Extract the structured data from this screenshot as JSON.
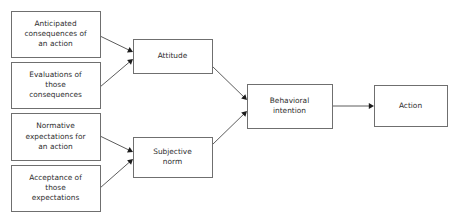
{
  "diagram": {
    "type": "flowchart",
    "background_color": "#ffffff",
    "box_fill": "#ffffff",
    "box_border_color": "#6f6f6f",
    "text_color": "#2e2e2e",
    "arrow_color": "#1c1c1c",
    "nodes": [
      {
        "id": "anticipated-consequences",
        "lines": [
          "Anticipated",
          "consequences of",
          "an action"
        ],
        "x": 11,
        "y": 11,
        "w": 89,
        "h": 46
      },
      {
        "id": "evaluations-consequences",
        "lines": [
          "Evaluations of",
          "those",
          "consequences"
        ],
        "x": 11,
        "y": 62,
        "w": 89,
        "h": 46
      },
      {
        "id": "normative-expectations",
        "lines": [
          "Normative",
          "expectations for",
          "an action"
        ],
        "x": 11,
        "y": 113,
        "w": 89,
        "h": 47
      },
      {
        "id": "acceptance-expectations",
        "lines": [
          "Acceptance of",
          "those",
          "expectations"
        ],
        "x": 11,
        "y": 165,
        "w": 89,
        "h": 46
      },
      {
        "id": "attitude",
        "lines": [
          "Attitude"
        ],
        "x": 133,
        "y": 39,
        "w": 79,
        "h": 34
      },
      {
        "id": "subjective-norm",
        "lines": [
          "Subjective",
          "norm"
        ],
        "x": 133,
        "y": 137,
        "w": 79,
        "h": 40
      },
      {
        "id": "behavioral-intention",
        "lines": [
          "Behavioral",
          "intention"
        ],
        "x": 247,
        "y": 84,
        "w": 85,
        "h": 44
      },
      {
        "id": "action",
        "lines": [
          "Action"
        ],
        "x": 374,
        "y": 85,
        "w": 73,
        "h": 41
      }
    ],
    "edges": [
      {
        "id": "anticipated-to-attitude",
        "from": "anticipated-consequences",
        "to": "attitude",
        "x1": 100,
        "y1": 36,
        "x2": 133,
        "y2": 52
      },
      {
        "id": "evaluations-to-attitude",
        "from": "evaluations-consequences",
        "to": "attitude",
        "x1": 100,
        "y1": 87,
        "x2": 133,
        "y2": 59
      },
      {
        "id": "normative-to-subjective-norm",
        "from": "normative-expectations",
        "to": "subjective-norm",
        "x1": 100,
        "y1": 136,
        "x2": 133,
        "y2": 152
      },
      {
        "id": "acceptance-to-subjective-norm",
        "from": "acceptance-expectations",
        "to": "subjective-norm",
        "x1": 100,
        "y1": 188,
        "x2": 133,
        "y2": 159
      },
      {
        "id": "attitude-to-intention",
        "from": "attitude",
        "to": "behavioral-intention",
        "x1": 212,
        "y1": 66,
        "x2": 247,
        "y2": 100
      },
      {
        "id": "subjective-norm-to-intention",
        "from": "subjective-norm",
        "to": "behavioral-intention",
        "x1": 212,
        "y1": 145,
        "x2": 247,
        "y2": 111
      },
      {
        "id": "intention-to-action",
        "from": "behavioral-intention",
        "to": "action",
        "x1": 332,
        "y1": 106,
        "x2": 374,
        "y2": 106
      }
    ]
  }
}
